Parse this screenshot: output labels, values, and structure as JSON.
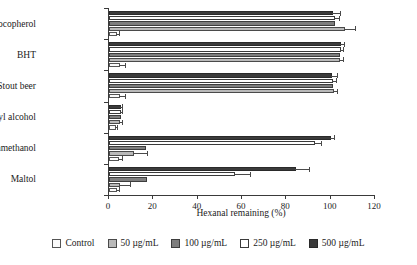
{
  "chart_data": {
    "type": "bar",
    "orientation": "horizontal",
    "title": "",
    "xlabel": "Hexanal remaining (%)",
    "ylabel": "",
    "xlim": [
      0,
      120
    ],
    "xticks": [
      0,
      20,
      40,
      60,
      80,
      100,
      120
    ],
    "xtick_labels": [
      "0",
      "20",
      "40",
      "60",
      "80",
      "100",
      "120"
    ],
    "grid": false,
    "legend_position": "bottom",
    "categories": [
      "Alpha-tocopherol",
      "BHT",
      "Stout beer",
      "Phenylethyl alcohol",
      "2-furanmethanol",
      "Maltol"
    ],
    "series": [
      {
        "name": "Control",
        "color": "#fbfbfb",
        "values": [
          3.5,
          5.0,
          5.0,
          3.0,
          4.5,
          3.5
        ],
        "errors": [
          1.5,
          2.5,
          2.5,
          1.2,
          1.8,
          1.5
        ]
      },
      {
        "name": "50 µg/mL",
        "color": "#b9b9b9",
        "values": [
          106.5,
          104.0,
          101.5,
          5.0,
          11.5,
          5.0
        ],
        "errors": [
          5.0,
          2.0,
          2.0,
          1.5,
          6.0,
          5.0
        ]
      },
      {
        "name": "100 µg/mL",
        "color": "#7e7e7e",
        "values": [
          102.0,
          104.0,
          101.0,
          5.5,
          16.5,
          17.0
        ]
      },
      {
        "name": "250 µg/mL",
        "color": "#ffffff",
        "values": [
          102.0,
          104.5,
          101.0,
          5.5,
          93.0,
          57.0
        ],
        "errors": [
          2.0,
          1.5,
          2.0,
          1.0,
          3.0,
          7.0
        ]
      },
      {
        "name": "500 µg/mL",
        "color": "#3b3b3b",
        "values": [
          101.0,
          104.5,
          100.5,
          5.5,
          100.0,
          84.5
        ],
        "errors": [
          3.5,
          2.0,
          3.0,
          1.0,
          2.0,
          6.0
        ]
      }
    ]
  },
  "legend": {
    "items": [
      {
        "label": "Control",
        "swatch": "swatch-control"
      },
      {
        "label": "50 µg/mL",
        "swatch": "swatch-50"
      },
      {
        "label": "100 µg/mL",
        "swatch": "swatch-100"
      },
      {
        "label": "250 µg/mL",
        "swatch": "swatch-250"
      },
      {
        "label": "500 µg/mL",
        "swatch": "swatch-500"
      }
    ]
  }
}
